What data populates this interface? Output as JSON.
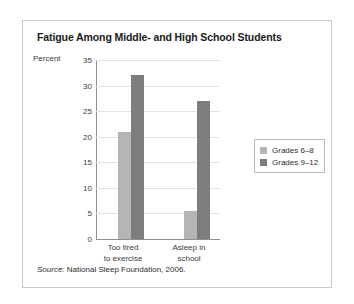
{
  "figure": {
    "title": "Fatigue Among Middle- and High School Students",
    "source_prefix": "Source:",
    "source_text": " National Sleep Foundation, 2006."
  },
  "colors": {
    "series_light": "#b5b5b5",
    "series_dark": "#7d7d7d",
    "frame_border": "#c9c9c9",
    "axis_line": "#8f8f8f",
    "gridline": "#e2e2e2"
  },
  "chart_data": {
    "type": "bar",
    "title": "Fatigue Among Middle- and High School Students",
    "xlabel": "",
    "ylabel": "Percent",
    "ylim": [
      0,
      35
    ],
    "yticks": [
      0,
      5,
      10,
      15,
      20,
      25,
      30,
      35
    ],
    "ytick_labels": [
      "0",
      "5",
      "10",
      "15",
      "20",
      "25",
      "30",
      "35"
    ],
    "grid": true,
    "legend_position": "right",
    "categories": [
      "Too tired to exercise",
      "Asleep in school"
    ],
    "category_lines": [
      [
        "Too tired",
        "to exercise"
      ],
      [
        "Asleep in",
        "school"
      ]
    ],
    "series": [
      {
        "name": "Grades 6–8",
        "color": "#b5b5b5",
        "values": [
          21,
          5.5
        ]
      },
      {
        "name": "Grades 9–12",
        "color": "#7d7d7d",
        "values": [
          32,
          27
        ]
      }
    ]
  }
}
